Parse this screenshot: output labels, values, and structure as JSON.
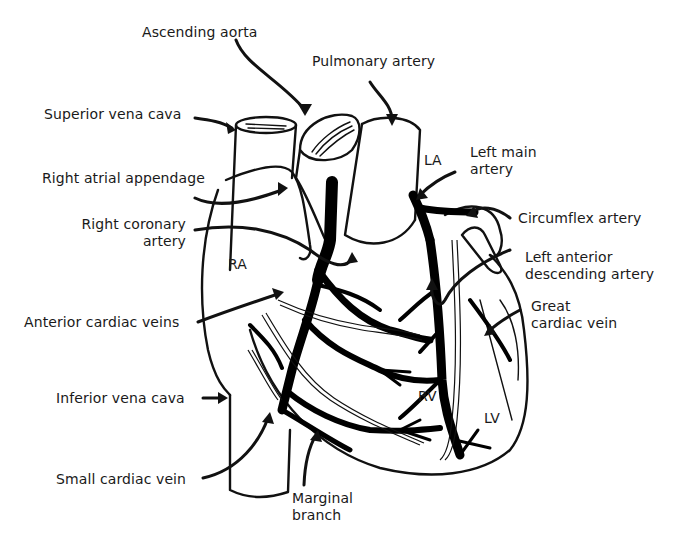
{
  "diagram": {
    "labels": {
      "ascending_aorta": "Ascending aorta",
      "pulmonary_artery": "Pulmonary artery",
      "superior_vena_cava": "Superior vena cava",
      "right_atrial_appendage": "Right atrial appendage",
      "right_coronary_artery_1": "Right coronary",
      "right_coronary_artery_2": "artery",
      "left_main_artery_1": "Left main",
      "left_main_artery_2": "artery",
      "circumflex_artery": "Circumflex artery",
      "left_anterior_descending_1": "Left anterior",
      "left_anterior_descending_2": "descending artery",
      "great_cardiac_vein_1": "Great",
      "great_cardiac_vein_2": "cardiac vein",
      "anterior_cardiac_veins": "Anterior cardiac veins",
      "inferior_vena_cava": "Inferior vena cava",
      "small_cardiac_vein": "Small cardiac vein",
      "marginal_branch_1": "Marginal",
      "marginal_branch_2": "branch"
    },
    "chambers": {
      "ra": "RA",
      "la": "LA",
      "rv": "RV",
      "lv": "LV"
    },
    "colors": {
      "ink": "#111111",
      "background": "#ffffff"
    }
  }
}
